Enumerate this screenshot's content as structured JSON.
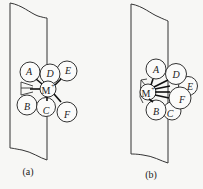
{
  "figure": {
    "panels": [
      {
        "id": "a",
        "caption": "(a)",
        "center_ion": {
          "label": "M",
          "charge": "+"
        },
        "atoms": [
          {
            "label": "A"
          },
          {
            "label": "D"
          },
          {
            "label": "E"
          },
          {
            "label": "B"
          },
          {
            "label": "C"
          },
          {
            "label": "F"
          }
        ]
      },
      {
        "id": "b",
        "caption": "(b)",
        "center_ion": {
          "label": "M",
          "charge": "+"
        },
        "atoms": [
          {
            "label": "A"
          },
          {
            "label": "D"
          },
          {
            "label": "E"
          },
          {
            "label": "F"
          },
          {
            "label": "B"
          },
          {
            "label": "C"
          }
        ]
      }
    ]
  }
}
